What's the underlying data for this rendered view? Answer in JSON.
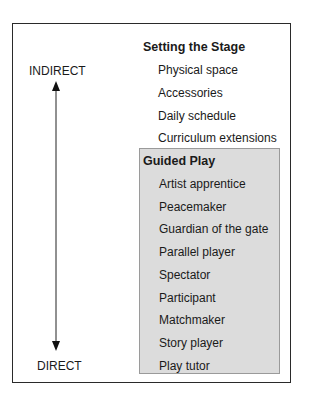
{
  "diagram": {
    "axis": {
      "top_label": "INDIRECT",
      "bottom_label": "DIRECT",
      "arrow": "double-headed-vertical"
    },
    "sections": [
      {
        "title": "Setting the Stage",
        "shaded": false,
        "items": [
          "Physical space",
          "Accessories",
          "Daily schedule",
          "Curriculum extensions"
        ]
      },
      {
        "title": "Guided Play",
        "shaded": true,
        "items": [
          "Artist apprentice",
          "Peacemaker",
          "Guardian of the gate",
          "Parallel player",
          "Spectator",
          "Participant",
          "Matchmaker",
          "Story player",
          "Play tutor"
        ]
      }
    ],
    "colors": {
      "border": "#2a2a2a",
      "panel_fill": "#dcdcdc",
      "text": "#1a1a1a"
    }
  }
}
